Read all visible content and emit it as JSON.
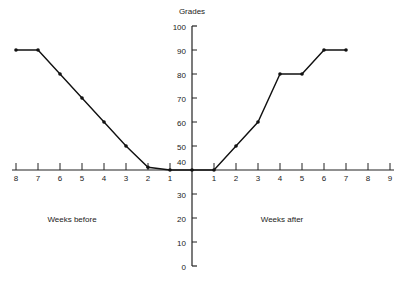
{
  "chart_data": {
    "type": "line",
    "title": "",
    "ylabel": "Grades",
    "xlabel_left": "Weeks before",
    "xlabel_right": "Weeks after",
    "ylim": [
      0,
      100
    ],
    "yticks": [
      0,
      10,
      20,
      30,
      40,
      50,
      60,
      70,
      80,
      90,
      100
    ],
    "xticks_before": [
      "8",
      "7",
      "6",
      "5",
      "4",
      "3",
      "2",
      "1"
    ],
    "xticks_after": [
      "1",
      "2",
      "3",
      "4",
      "5",
      "6",
      "7",
      "8",
      "9"
    ],
    "grid": false,
    "series": [
      {
        "name": "Grades",
        "x": [
          -8,
          -7,
          -6,
          -5,
          -4,
          -3,
          -2,
          -1,
          0,
          1,
          2,
          3,
          4,
          5,
          6,
          7
        ],
        "values": [
          90,
          90,
          80,
          70,
          60,
          50,
          43,
          40,
          40,
          40,
          50,
          60,
          80,
          80,
          90,
          90
        ]
      }
    ]
  }
}
